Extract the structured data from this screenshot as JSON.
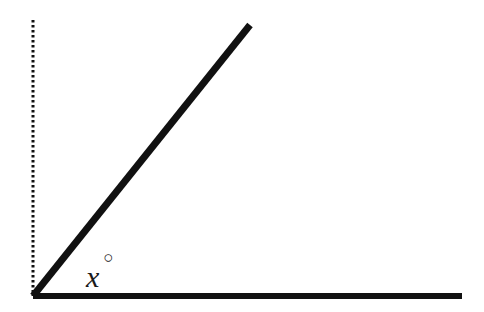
{
  "figure": {
    "type": "geometry-angle-diagram",
    "background_color": "#ffffff",
    "stroke_color": "#111111",
    "canvas": {
      "width": 484,
      "height": 312
    },
    "vertex": {
      "x": 33,
      "y": 296
    },
    "label": {
      "variable": "x",
      "degree_symbol": "○",
      "text": "x°",
      "x": 86,
      "y": 246
    },
    "elements": {
      "horizontal_ray": {
        "name": "horizontal-ray",
        "from": {
          "x": 33,
          "y": 296
        },
        "to": {
          "x": 462,
          "y": 296
        },
        "thickness": 6,
        "style": "solid"
      },
      "diagonal_ray": {
        "name": "diagonal-ray",
        "from": {
          "x": 33,
          "y": 296
        },
        "to": {
          "x": 250,
          "y": 25
        },
        "thickness": 7,
        "style": "solid",
        "angle_degrees": 51
      },
      "vertical_reference": {
        "name": "vertical-dotted-reference-line",
        "from": {
          "x": 33,
          "y": 20
        },
        "to": {
          "x": 33,
          "y": 296
        },
        "thickness": 3,
        "style": "dotted",
        "dash_pattern": "2.5 2.5"
      }
    }
  },
  "chart_data": {
    "type": "diagram",
    "title": "",
    "annotations": [
      {
        "text": "x°",
        "x": 100,
        "y": 266
      }
    ],
    "segments": [
      {
        "name": "horizontal-ray",
        "x1": 33,
        "y1": 296,
        "x2": 462,
        "y2": 296,
        "style": "solid"
      },
      {
        "name": "diagonal-ray",
        "x1": 33,
        "y1": 296,
        "x2": 250,
        "y2": 25,
        "style": "solid"
      },
      {
        "name": "vertical-dotted-reference-line",
        "x1": 33,
        "y1": 20,
        "x2": 33,
        "y2": 296,
        "style": "dotted"
      }
    ],
    "grid": false,
    "legend": false
  }
}
